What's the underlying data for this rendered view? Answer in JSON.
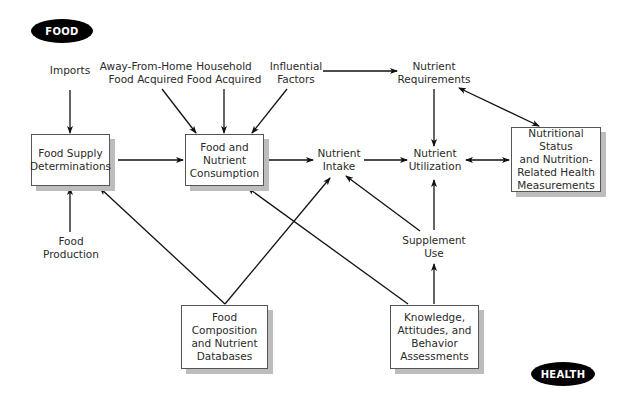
{
  "title_labels": {
    "food": "FOOD",
    "health": "HEALTH"
  },
  "colors": {
    "line": "#111111",
    "box_border": "#555555",
    "box_shadow": "#bdbdbd",
    "pill_bg": "#000000",
    "pill_text": "#ffffff"
  },
  "boxes": {
    "food_supply": "Food Supply\nDeterminations",
    "food_nutrient_consumption": "Food and\nNutrient\nConsumption",
    "nutritional_status": "Nutritional Status\nand Nutrition-\nRelated Health\nMeasurements",
    "food_composition": "Food\nComposition\nand Nutrient\nDatabases",
    "knowledge": "Knowledge,\nAttitudes, and\nBehavior\nAssessments"
  },
  "labels": {
    "imports": "Imports",
    "away_from_home": "Away-From-Home\nFood Acquired",
    "household": "Household\nFood Acquired",
    "influential": "Influential\nFactors",
    "nutrient_requirements": "Nutrient\nRequirements",
    "nutrient_intake": "Nutrient\nIntake",
    "nutrient_utilization": "Nutrient\nUtilization",
    "supplement_use": "Supplement\nUse",
    "food_production": "Food\nProduction"
  },
  "edges": [
    {
      "from": "Imports",
      "to": "Food Supply Determinations"
    },
    {
      "from": "Food Production",
      "to": "Food Supply Determinations"
    },
    {
      "from": "Food Supply Determinations",
      "to": "Food and Nutrient Consumption"
    },
    {
      "from": "Away-From-Home Food Acquired",
      "to": "Food and Nutrient Consumption"
    },
    {
      "from": "Household Food Acquired",
      "to": "Food and Nutrient Consumption"
    },
    {
      "from": "Influential Factors",
      "to": "Food and Nutrient Consumption"
    },
    {
      "from": "Influential Factors",
      "to": "Nutrient Requirements"
    },
    {
      "from": "Food and Nutrient Consumption",
      "to": "Nutrient Intake"
    },
    {
      "from": "Nutrient Intake",
      "to": "Nutrient Utilization"
    },
    {
      "from": "Nutrient Requirements",
      "to": "Nutrient Utilization"
    },
    {
      "from": "Nutrient Requirements",
      "to": "Nutritional Status and Nutrition-Related Health Measurements",
      "bidirectional": true
    },
    {
      "from": "Nutrient Utilization",
      "to": "Nutritional Status and Nutrition-Related Health Measurements",
      "bidirectional": true
    },
    {
      "from": "Supplement Use",
      "to": "Nutrient Utilization"
    },
    {
      "from": "Supplement Use",
      "to": "Nutrient Intake"
    },
    {
      "from": "Knowledge, Attitudes, and Behavior Assessments",
      "to": "Supplement Use"
    },
    {
      "from": "Knowledge, Attitudes, and Behavior Assessments",
      "to": "Food and Nutrient Consumption"
    },
    {
      "from": "Food Composition and Nutrient Databases",
      "to": "Food Supply Determinations"
    },
    {
      "from": "Food Composition and Nutrient Databases",
      "to": "Nutrient Intake"
    }
  ]
}
